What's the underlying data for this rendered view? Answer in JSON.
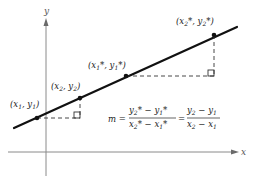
{
  "diagram": {
    "axes": {
      "x_label": "x",
      "y_label": "y"
    },
    "points": [
      {
        "id": "p1",
        "label_base": "(x",
        "sub1": "1",
        "mid": ", y",
        "sub2": "1",
        "end": ")"
      },
      {
        "id": "p2",
        "label_base": "(x",
        "sub1": "2",
        "mid": ", y",
        "sub2": "2",
        "end": ")"
      },
      {
        "id": "p1star",
        "label_base": "(x",
        "sub1": "1",
        "mid": "*, y",
        "sub2": "1",
        "end": "*)"
      },
      {
        "id": "p2star",
        "label_base": "(x",
        "sub1": "2",
        "mid": "*, y",
        "sub2": "2",
        "end": "*)"
      }
    ],
    "formula": {
      "lhs": "m =",
      "frac1_num": [
        "y",
        "2",
        "* − y",
        "1",
        "*"
      ],
      "frac1_den": [
        "x",
        "2",
        "* − x",
        "1",
        "*"
      ],
      "equals": "=",
      "frac2_num": [
        "y",
        "2",
        " − y",
        "1"
      ],
      "frac2_den": [
        "x",
        "2",
        " − x",
        "1"
      ]
    }
  }
}
